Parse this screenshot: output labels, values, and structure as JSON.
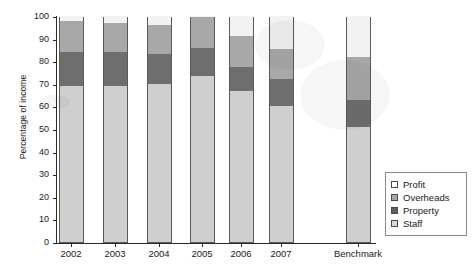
{
  "chart_data": {
    "type": "bar",
    "subtype": "stacked-bar-100",
    "title": "",
    "xlabel": "",
    "ylabel": "Percentage of income",
    "ylim": [
      0,
      100
    ],
    "ytick_step": 10,
    "yticks": [
      0,
      10,
      20,
      30,
      40,
      50,
      60,
      70,
      80,
      90,
      100
    ],
    "grid": false,
    "legend_position": "right",
    "categories": [
      "2002",
      "2003",
      "2004",
      "2005",
      "2006",
      "2007",
      "Benchmark"
    ],
    "series": [
      {
        "name": "Staff",
        "color": "#cfcfcf",
        "values": [
          69,
          69,
          70,
          73.5,
          67,
          60,
          51
        ]
      },
      {
        "name": "Property",
        "color": "#6e6e6e",
        "values": [
          15,
          15,
          13,
          12.5,
          10.5,
          12,
          12
        ]
      },
      {
        "name": "Overheads",
        "color": "#a8a8a8",
        "values": [
          14,
          13,
          13,
          13.5,
          13.5,
          13.5,
          19
        ]
      },
      {
        "name": "Profit",
        "color": "#f2f2f2",
        "values": [
          2,
          3,
          4,
          0.5,
          9,
          14.5,
          18
        ]
      }
    ],
    "cumulative_tops": {
      "Staff": [
        69,
        69,
        70,
        73.5,
        67,
        60,
        51
      ],
      "Property": [
        84,
        84,
        83,
        86,
        77.5,
        72,
        63
      ],
      "Overheads": [
        98,
        97,
        96,
        99.5,
        91,
        85.5,
        82
      ],
      "Profit": [
        100,
        100,
        100,
        100,
        100,
        100,
        100
      ]
    },
    "legend_entries": [
      "Profit",
      "Overheads",
      "Property",
      "Staff"
    ]
  }
}
